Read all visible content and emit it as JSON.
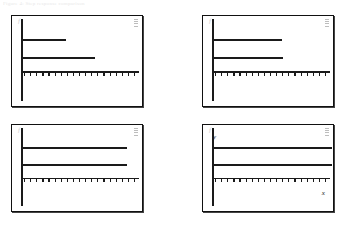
{
  "figure": {
    "caption": "Figure 4: Step response comparison",
    "background_color": "#ffffff",
    "line_color": "#1a1a1a",
    "frame_color": "#111111"
  },
  "chart_data": [
    {
      "type": "line",
      "title": "",
      "panel_name": "top-left",
      "xlabel": "",
      "ylabel": "",
      "ylabel_text": "f",
      "xlim": [
        0,
        100
      ],
      "ylim": [
        0,
        100
      ],
      "grid": false,
      "legend": "none",
      "axis_origin_x": 7,
      "axis_baseline_y": 62,
      "x_tick_count": 19,
      "series": [
        {
          "name": "upper-segment",
          "y": 26,
          "x_start": 7,
          "x_end": 42
        },
        {
          "name": "lower-segment",
          "y": 46,
          "x_start": 7,
          "x_end": 64
        }
      ]
    },
    {
      "type": "line",
      "title": "",
      "panel_name": "top-right",
      "xlabel": "",
      "ylabel": "",
      "ylabel_text": "f",
      "xlim": [
        0,
        100
      ],
      "ylim": [
        0,
        100
      ],
      "grid": false,
      "legend": "none",
      "axis_origin_x": 7,
      "axis_baseline_y": 62,
      "x_tick_count": 19,
      "series": [
        {
          "name": "upper-segment",
          "y": 26,
          "x_start": 7,
          "x_end": 61
        },
        {
          "name": "lower-segment",
          "y": 46,
          "x_start": 7,
          "x_end": 62
        }
      ]
    },
    {
      "type": "line",
      "title": "",
      "panel_name": "bottom-left",
      "xlabel": "",
      "ylabel": "",
      "ylabel_text": "f",
      "xlim": [
        0,
        100
      ],
      "ylim": [
        0,
        100
      ],
      "grid": false,
      "legend": "none",
      "axis_origin_x": 7,
      "axis_baseline_y": 62,
      "x_tick_count": 19,
      "series": [
        {
          "name": "upper-segment",
          "y": 26,
          "x_start": 7,
          "x_end": 89
        },
        {
          "name": "lower-segment",
          "y": 46,
          "x_start": 7,
          "x_end": 89
        }
      ]
    },
    {
      "type": "line",
      "title": "",
      "panel_name": "bottom-right",
      "xlabel": "x",
      "ylabel": "y",
      "ylabel_text": "f",
      "xlim": [
        0,
        100
      ],
      "ylim": [
        0,
        100
      ],
      "grid": false,
      "legend": "none",
      "axis_origin_x": 7,
      "axis_baseline_y": 62,
      "x_tick_count": 19,
      "series": [
        {
          "name": "upper-segment",
          "y": 26,
          "x_start": 7,
          "x_end": 100
        },
        {
          "name": "lower-segment",
          "y": 46,
          "x_start": 7,
          "x_end": 100
        }
      ]
    }
  ],
  "labels": {
    "y_axis": "y",
    "x_axis": "x",
    "f_marker": "f"
  }
}
